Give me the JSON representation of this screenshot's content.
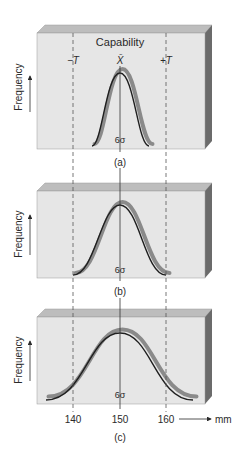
{
  "diagram": {
    "title_label": "Capability",
    "mean_label": "X̄",
    "lower_tolerance_label": "−T",
    "upper_tolerance_label": "+T",
    "y_axis_label": "Frequency",
    "spread_label": "6σ",
    "unit_label": "mm",
    "ticks": [
      {
        "value": 140,
        "label": "140"
      },
      {
        "value": 150,
        "label": "150"
      },
      {
        "value": 160,
        "label": "160"
      }
    ],
    "panels": [
      {
        "id": "a",
        "caption": "(a)",
        "relative_spread": 0.32,
        "description": "Narrow distribution well within tolerance"
      },
      {
        "id": "b",
        "caption": "(b)",
        "relative_spread": 0.5,
        "description": "Distribution spread equals tolerance width"
      },
      {
        "id": "c",
        "caption": "(c)",
        "relative_spread": 0.78,
        "description": "Distribution spread exceeds tolerance width"
      }
    ],
    "colors": {
      "box_front": "#e6e6e6",
      "box_top": "#bdbdbd",
      "box_side": "#6b6b6b",
      "curve": "#1f1f1f",
      "curve_shadow": "#8a8a8a",
      "dashed_line": "#555555",
      "text": "#2a2a2a"
    }
  }
}
